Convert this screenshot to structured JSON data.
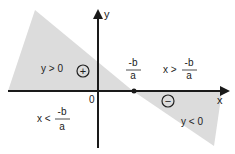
{
  "diagram": {
    "axis_x_label": "x",
    "axis_y_label": "y",
    "origin_label": "0",
    "region_positive_label": "y > 0",
    "region_negative_label": "y < 0",
    "positive_sign": "+",
    "negative_sign": "−",
    "root_numerator": "-b",
    "root_denominator": "a",
    "right_condition_prefix": "x >",
    "right_condition_numerator": "-b",
    "right_condition_denominator": "a",
    "left_condition_prefix": "x <",
    "left_condition_numerator": "-b",
    "left_condition_denominator": "a",
    "shade_color": "#dcdcdc",
    "line_color": "#1a1a1a"
  }
}
